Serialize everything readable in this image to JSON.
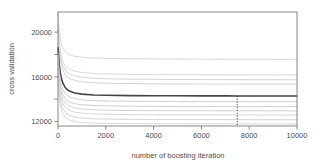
{
  "chart_data": {
    "type": "line",
    "title": "",
    "subtitle": "",
    "xlabel": "number of boosting iteration",
    "ylabel": "cross validation",
    "xlim": [
      0,
      10000
    ],
    "ylim": [
      11600,
      21800
    ],
    "grid": false,
    "legend": null,
    "x_ticks": [
      0,
      2000,
      4000,
      6000,
      8000,
      10000
    ],
    "x_tick_labels": [
      "0",
      "2000",
      "4000",
      "6000",
      "8000",
      "10000"
    ],
    "y_ticks": [
      12000,
      14000,
      16000,
      18000,
      20000
    ],
    "y_tick_labels": [
      "12000",
      "",
      "16000",
      "",
      "20000"
    ],
    "y_major_labels": [
      "12000",
      "16000",
      "20000"
    ],
    "annotations": [
      {
        "name": "optimal-iteration-marker",
        "type": "vline",
        "x": 7500,
        "y_top": 14300,
        "y_bottom": 11600,
        "style": "dotted",
        "color": "#3a3a3a"
      }
    ],
    "x": [
      0,
      50,
      100,
      150,
      200,
      300,
      400,
      500,
      700,
      1000,
      1500,
      2000,
      3000,
      4000,
      5000,
      6000,
      7000,
      7500,
      8000,
      9000,
      10000
    ],
    "series": [
      {
        "name": "fold-1",
        "color": "#d8d8d8",
        "width": 1.0,
        "highlight": false,
        "values": [
          21800,
          20300,
          19400,
          18900,
          18600,
          18250,
          18050,
          17950,
          17830,
          17750,
          17680,
          17650,
          17620,
          17600,
          17590,
          17580,
          17575,
          17572,
          17570,
          17568,
          17565
        ]
      },
      {
        "name": "fold-2",
        "color": "#dadada",
        "width": 1.0,
        "highlight": false,
        "values": [
          21000,
          19300,
          18300,
          17750,
          17400,
          17000,
          16780,
          16650,
          16500,
          16390,
          16300,
          16260,
          16220,
          16200,
          16190,
          16180,
          16175,
          16172,
          16170,
          16168,
          16165
        ]
      },
      {
        "name": "fold-3",
        "color": "#d5d5d5",
        "width": 1.0,
        "highlight": false,
        "values": [
          20600,
          18900,
          17900,
          17350,
          17000,
          16600,
          16380,
          16240,
          16080,
          15960,
          15870,
          15830,
          15790,
          15770,
          15760,
          15755,
          15750,
          15748,
          15745,
          15742,
          15740
        ]
      },
      {
        "name": "fold-4",
        "color": "#d2d2d2",
        "width": 1.0,
        "highlight": false,
        "values": [
          20200,
          18500,
          17500,
          16950,
          16600,
          16200,
          15980,
          15840,
          15680,
          15560,
          15470,
          15430,
          15390,
          15370,
          15360,
          15355,
          15350,
          15348,
          15345,
          15342,
          15340
        ]
      },
      {
        "name": "cv-mean",
        "color": "#444444",
        "width": 1.6,
        "highlight": true,
        "values": [
          18600,
          17100,
          16300,
          15800,
          15450,
          15050,
          14830,
          14700,
          14560,
          14450,
          14380,
          14350,
          14320,
          14305,
          14300,
          14295,
          14292,
          14290,
          14288,
          14285,
          14283
        ]
      },
      {
        "name": "fold-5",
        "color": "#cfcfcf",
        "width": 1.0,
        "highlight": false,
        "values": [
          18100,
          16500,
          15700,
          15200,
          14880,
          14500,
          14300,
          14180,
          14040,
          13940,
          13870,
          13840,
          13810,
          13795,
          13788,
          13783,
          13780,
          13778,
          13776,
          13774,
          13772
        ]
      },
      {
        "name": "fold-6",
        "color": "#d0d0d0",
        "width": 1.0,
        "highlight": false,
        "values": [
          17600,
          16000,
          15200,
          14720,
          14420,
          14060,
          13860,
          13740,
          13600,
          13500,
          13430,
          13400,
          13370,
          13355,
          13348,
          13343,
          13340,
          13338,
          13336,
          13334,
          13332
        ]
      },
      {
        "name": "fold-7",
        "color": "#d3d3d3",
        "width": 1.0,
        "highlight": false,
        "values": [
          17200,
          15600,
          14800,
          14330,
          14030,
          13680,
          13480,
          13360,
          13220,
          13120,
          13050,
          13020,
          12990,
          12975,
          12968,
          12963,
          12960,
          12958,
          12956,
          12954,
          12952
        ]
      },
      {
        "name": "fold-8",
        "color": "#d6d6d6",
        "width": 1.0,
        "highlight": false,
        "values": [
          16800,
          15200,
          14400,
          13940,
          13640,
          13300,
          13100,
          12980,
          12840,
          12745,
          12680,
          12650,
          12620,
          12605,
          12598,
          12594,
          12590,
          12588,
          12586,
          12584,
          12582
        ]
      },
      {
        "name": "fold-9",
        "color": "#d4d4d4",
        "width": 1.0,
        "highlight": false,
        "values": [
          16300,
          14700,
          13900,
          13450,
          13160,
          12830,
          12640,
          12530,
          12400,
          12310,
          12250,
          12220,
          12195,
          12182,
          12176,
          12172,
          12169,
          12167,
          12165,
          12163,
          12161
        ]
      },
      {
        "name": "fold-10",
        "color": "#d7d7d7",
        "width": 1.0,
        "highlight": false,
        "values": [
          15800,
          14200,
          13420,
          12980,
          12700,
          12390,
          12210,
          12110,
          11990,
          11910,
          11855,
          11830,
          11810,
          11800,
          11795,
          11792,
          11790,
          11789,
          11788,
          11787,
          11786
        ]
      }
    ]
  },
  "axes": {
    "y_axis_title": "cross validation",
    "x_axis_title": "number of boosting iteration"
  }
}
